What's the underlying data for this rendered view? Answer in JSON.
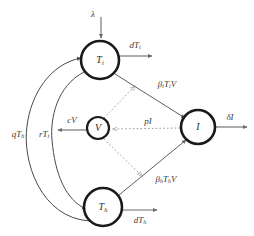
{
  "diagram": {
    "background_color": "#ffffff",
    "node_stroke_color": "#1a1a1a",
    "solid_edge_color": "#5e5e5e",
    "dotted_edge_color": "#9a9a9a",
    "nodes": [
      {
        "id": "Ti",
        "label": "T",
        "subscript": "i",
        "cx": 100,
        "cy": 60,
        "r": 19
      },
      {
        "id": "Th",
        "label": "T",
        "subscript": "h",
        "cx": 103,
        "cy": 207,
        "r": 19
      },
      {
        "id": "V",
        "label": "V",
        "subscript": "",
        "cx": 98,
        "cy": 128,
        "r": 11
      },
      {
        "id": "I",
        "label": "I",
        "subscript": "",
        "cx": 198,
        "cy": 127,
        "r": 17
      }
    ],
    "edges": [
      {
        "id": "influx-Ti",
        "label": "λ",
        "subscript": "",
        "style": "solid",
        "from": "source",
        "to": "Ti"
      },
      {
        "id": "death-Ti",
        "label": "dT",
        "subscript": "i",
        "style": "solid",
        "from": "Ti",
        "to": "sink"
      },
      {
        "id": "death-Th",
        "label": "dT",
        "subscript": "h",
        "style": "solid",
        "from": "Th",
        "to": "sink"
      },
      {
        "id": "clear-V",
        "label": "cV",
        "subscript": "",
        "style": "solid",
        "from": "V",
        "to": "sink"
      },
      {
        "id": "death-I",
        "label": "δI",
        "subscript": "",
        "style": "solid",
        "from": "I",
        "to": "sink"
      },
      {
        "id": "infect-Ti",
        "label": "β",
        "subscript": "i",
        "suffix": "T",
        "suffix_sub": "i",
        "suffix2": "V",
        "style": "solid",
        "from": "Ti",
        "to": "I"
      },
      {
        "id": "infect-Th",
        "label": "β",
        "subscript": "h",
        "suffix": "T",
        "suffix_sub": "h",
        "suffix2": "V",
        "style": "solid",
        "from": "Th",
        "to": "I"
      },
      {
        "id": "produce-V",
        "label": "pI",
        "subscript": "",
        "style": "dotted",
        "from": "I",
        "to": "V"
      },
      {
        "id": "virus-to-Ti",
        "label": "",
        "subscript": "",
        "style": "dotted",
        "from": "V",
        "to": "Ti"
      },
      {
        "id": "virus-to-Th",
        "label": "",
        "subscript": "",
        "style": "dotted",
        "from": "V",
        "to": "Th"
      },
      {
        "id": "convert-qTh",
        "label": "qT",
        "subscript": "h",
        "style": "curve",
        "from": "Th",
        "to": "Ti"
      },
      {
        "id": "convert-rTi",
        "label": "rT",
        "subscript": "i",
        "style": "curve",
        "from": "Ti",
        "to": "Th"
      }
    ],
    "labels": {
      "lambda": "λ",
      "dTi_main": "dT",
      "dTi_sub": "i",
      "dTh_main": "dT",
      "dTh_sub": "h",
      "cV": "cV",
      "deltaI": "δI",
      "pI": "pI",
      "beta_i_main": "β",
      "beta_i_sub": "i",
      "beta_i_T": "T",
      "beta_i_Tsub": "i",
      "beta_i_V": "V",
      "beta_h_main": "β",
      "beta_h_sub": "h",
      "beta_h_T": "T",
      "beta_h_Tsub": "h",
      "beta_h_V": "V",
      "qTh_main": "qT",
      "qTh_sub": "h",
      "rTi_main": "rT",
      "rTi_sub": "i",
      "node_Ti_main": "T",
      "node_Ti_sub": "i",
      "node_Th_main": "T",
      "node_Th_sub": "h",
      "node_V": "V",
      "node_I": "I"
    }
  }
}
